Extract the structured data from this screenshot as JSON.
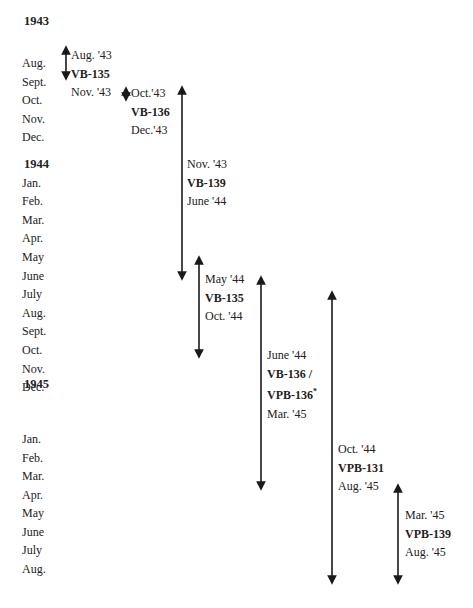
{
  "years": [
    {
      "label": "1943",
      "months": [
        "Aug.",
        "Sept.",
        "Oct.",
        "Nov.",
        "Dec."
      ]
    },
    {
      "label": "1944",
      "months": [
        "Jan.",
        "Feb.",
        "Mar.",
        "Apr.",
        "May",
        "June",
        "July",
        "Aug.",
        "Sept.",
        "Oct.",
        "Nov.",
        "Dec."
      ]
    },
    {
      "label": "1945",
      "months": [
        "Jan.",
        "Feb.",
        "Mar.",
        "Apr.",
        "May",
        "June",
        "July",
        "Aug."
      ]
    }
  ],
  "deployments": [
    {
      "start": "Aug. '43",
      "squadron": "VB-135",
      "end": "Nov. '43"
    },
    {
      "start": "Oct.'43",
      "squadron": "VB-136",
      "end": "Dec.'43"
    },
    {
      "start": "Nov. '43",
      "squadron": "VB-139",
      "end": "June '44"
    },
    {
      "start": "May '44",
      "squadron": "VB-135",
      "end": "Oct. '44"
    },
    {
      "start": "June '44",
      "squadron": "VB-136 /",
      "squadron2": "VPB-136",
      "footnote": "*",
      "end": "Mar. '45"
    },
    {
      "start": "Oct. '44",
      "squadron": "VPB-131",
      "end": "Aug. '45"
    },
    {
      "start": "Mar. '45",
      "squadron": "VPB-139",
      "end": "Aug. '45"
    }
  ],
  "arrow_color": "#1a1a1a"
}
